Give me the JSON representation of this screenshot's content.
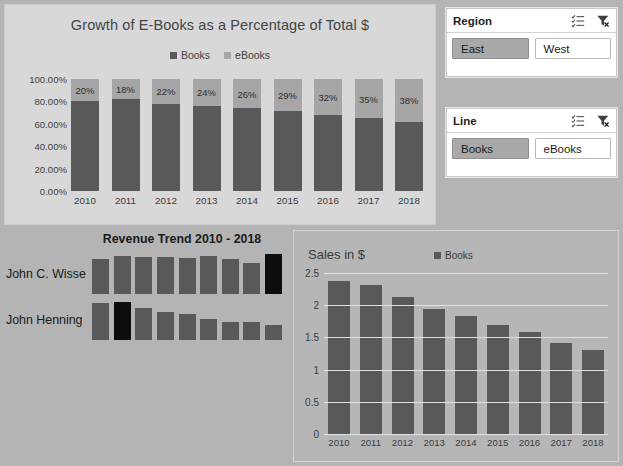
{
  "stacked_chart": {
    "title": "Growth of E-Books as a Percentage of Total $",
    "legend": [
      {
        "label": "Books",
        "color": "#595959"
      },
      {
        "label": "eBooks",
        "color": "#a6a6a6"
      }
    ],
    "y_ticks": [
      "100.00%",
      "80.00%",
      "60.00%",
      "40.00%",
      "20.00%",
      "0.00%"
    ]
  },
  "slicers": [
    {
      "title": "Region",
      "multiselect_icon": "multi-select-icon",
      "clear_filter_icon": "clear-filter-icon",
      "buttons": [
        {
          "label": "East",
          "selected": true
        },
        {
          "label": "West",
          "selected": false
        }
      ]
    },
    {
      "title": "Line",
      "multiselect_icon": "multi-select-icon",
      "clear_filter_icon": "clear-filter-icon",
      "buttons": [
        {
          "label": "Books",
          "selected": true
        },
        {
          "label": "eBooks",
          "selected": false
        }
      ]
    }
  ],
  "trend_chart": {
    "title": "Revenue Trend 2010 - 2018",
    "rows": [
      {
        "label": "John C. Wisse"
      },
      {
        "label": "John Henning"
      }
    ]
  },
  "sales_chart": {
    "title": "Sales in $",
    "legend_label": "Books",
    "legend_color": "#595959"
  },
  "chart_data": [
    {
      "id": "stacked",
      "type": "bar",
      "stacked": true,
      "title": "Growth of E-Books as a Percentage of Total $",
      "xlabel": "",
      "ylabel": "",
      "ylim": [
        0,
        1
      ],
      "grid": false,
      "legend_position": "top-center",
      "categories": [
        "2010",
        "2011",
        "2012",
        "2013",
        "2014",
        "2015",
        "2016",
        "2017",
        "2018"
      ],
      "ytick_labels": [
        "0.00%",
        "20.00%",
        "40.00%",
        "60.00%",
        "80.00%",
        "100.00%"
      ],
      "series": [
        {
          "name": "Books",
          "values": [
            0.8,
            0.82,
            0.78,
            0.76,
            0.74,
            0.71,
            0.68,
            0.65,
            0.62
          ]
        },
        {
          "name": "eBooks",
          "values": [
            0.2,
            0.18,
            0.22,
            0.24,
            0.26,
            0.29,
            0.32,
            0.35,
            0.38
          ]
        }
      ],
      "data_labels": [
        "20%",
        "18%",
        "22%",
        "24%",
        "26%",
        "29%",
        "32%",
        "35%",
        "38%"
      ]
    },
    {
      "id": "trend",
      "type": "bar",
      "title": "Revenue Trend 2010 - 2018",
      "xlabel": "",
      "ylabel": "",
      "grid": false,
      "legend_position": "none",
      "categories": [
        "2010",
        "2011",
        "2012",
        "2013",
        "2014",
        "2015",
        "2016",
        "2017",
        "2018"
      ],
      "series": [
        {
          "name": "John C. Wisse",
          "values": [
            0.88,
            0.94,
            0.92,
            0.93,
            0.9,
            0.95,
            0.88,
            0.78,
            1.0
          ]
        },
        {
          "name": "John Henning",
          "values": [
            0.92,
            0.96,
            0.8,
            0.7,
            0.66,
            0.52,
            0.46,
            0.44,
            0.38
          ]
        }
      ]
    },
    {
      "id": "sales",
      "type": "bar",
      "title": "Sales in $",
      "xlabel": "",
      "ylabel": "",
      "ylim": [
        0,
        2.5
      ],
      "grid": true,
      "legend_position": "top-center",
      "categories": [
        "2010",
        "2011",
        "2012",
        "2013",
        "2014",
        "2015",
        "2016",
        "2017",
        "2018"
      ],
      "ytick_labels": [
        "0",
        "0.5",
        "1",
        "1.5",
        "2",
        "2.5"
      ],
      "series": [
        {
          "name": "Books",
          "values": [
            2.37,
            2.31,
            2.12,
            1.94,
            1.83,
            1.69,
            1.58,
            1.42,
            1.3
          ]
        }
      ]
    }
  ]
}
